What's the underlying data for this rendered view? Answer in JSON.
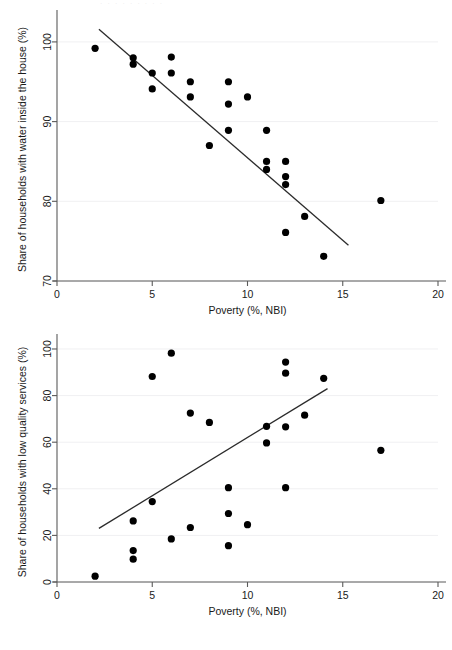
{
  "figure": {
    "ghost_caption": "· · · · · · · · ·",
    "background_color": "#ffffff",
    "point_color": "#000000",
    "fit_line_color": "#2b2b2b",
    "axis_color": "#5a5a5a"
  },
  "chart_data": [
    {
      "id": "water-inside-house",
      "type": "scatter",
      "title": "",
      "xlabel": "Poverty (%, NBI)",
      "ylabel": "Share of households with water inside the house (%)",
      "xlim": [
        0,
        20
      ],
      "ylim": [
        70,
        103
      ],
      "xticks": [
        0,
        5,
        10,
        15,
        20
      ],
      "xtick_labels": [
        "0",
        "5",
        "10",
        "15",
        "20"
      ],
      "yticks": [
        70,
        80,
        90,
        100
      ],
      "ytick_labels": [
        "70",
        "80",
        "90",
        "100"
      ],
      "grid": true,
      "legend": "none",
      "points": [
        {
          "x": 2.0,
          "y": 99.2
        },
        {
          "x": 4.0,
          "y": 98.0
        },
        {
          "x": 4.0,
          "y": 97.2
        },
        {
          "x": 5.0,
          "y": 96.1
        },
        {
          "x": 5.0,
          "y": 94.1
        },
        {
          "x": 6.0,
          "y": 98.1
        },
        {
          "x": 6.0,
          "y": 96.1
        },
        {
          "x": 7.0,
          "y": 95.0
        },
        {
          "x": 7.0,
          "y": 93.1
        },
        {
          "x": 8.0,
          "y": 87.0
        },
        {
          "x": 9.0,
          "y": 95.0
        },
        {
          "x": 9.0,
          "y": 92.2
        },
        {
          "x": 9.0,
          "y": 88.9
        },
        {
          "x": 10.0,
          "y": 93.1
        },
        {
          "x": 11.0,
          "y": 88.9
        },
        {
          "x": 11.0,
          "y": 85.0
        },
        {
          "x": 11.0,
          "y": 84.0
        },
        {
          "x": 12.0,
          "y": 85.0
        },
        {
          "x": 12.0,
          "y": 83.1
        },
        {
          "x": 12.0,
          "y": 82.1
        },
        {
          "x": 12.0,
          "y": 76.1
        },
        {
          "x": 13.0,
          "y": 78.1
        },
        {
          "x": 14.0,
          "y": 73.1
        },
        {
          "x": 17.0,
          "y": 80.1
        }
      ],
      "fit_line": {
        "x1": 2.2,
        "y1": 101.6,
        "x2": 15.3,
        "y2": 74.5
      }
    },
    {
      "id": "low-quality-services",
      "type": "scatter",
      "title": "",
      "xlabel": "Poverty (%, NBI)",
      "ylabel": "Share of households with low quality services (%)",
      "xlim": [
        0,
        20
      ],
      "ylim": [
        0,
        103
      ],
      "xticks": [
        0,
        5,
        10,
        15,
        20
      ],
      "xtick_labels": [
        "0",
        "5",
        "10",
        "15",
        "20"
      ],
      "yticks": [
        0,
        20,
        40,
        60,
        80,
        100
      ],
      "ytick_labels": [
        "0",
        "20",
        "40",
        "60",
        "80",
        "100"
      ],
      "grid": true,
      "legend": "none",
      "points": [
        {
          "x": 2.0,
          "y": 2.5
        },
        {
          "x": 4.0,
          "y": 13.5
        },
        {
          "x": 4.0,
          "y": 9.8
        },
        {
          "x": 4.0,
          "y": 26.2
        },
        {
          "x": 5.0,
          "y": 88.2
        },
        {
          "x": 5.0,
          "y": 34.5
        },
        {
          "x": 6.0,
          "y": 98.2
        },
        {
          "x": 6.0,
          "y": 18.5
        },
        {
          "x": 7.0,
          "y": 72.5
        },
        {
          "x": 7.0,
          "y": 23.4
        },
        {
          "x": 8.0,
          "y": 68.5
        },
        {
          "x": 9.0,
          "y": 40.5
        },
        {
          "x": 9.0,
          "y": 29.4
        },
        {
          "x": 9.0,
          "y": 15.6
        },
        {
          "x": 10.0,
          "y": 24.6
        },
        {
          "x": 11.0,
          "y": 66.8
        },
        {
          "x": 11.0,
          "y": 59.7
        },
        {
          "x": 12.0,
          "y": 94.4
        },
        {
          "x": 12.0,
          "y": 89.6
        },
        {
          "x": 12.0,
          "y": 66.6
        },
        {
          "x": 12.0,
          "y": 40.5
        },
        {
          "x": 13.0,
          "y": 71.6
        },
        {
          "x": 14.0,
          "y": 87.4
        },
        {
          "x": 17.0,
          "y": 56.5
        }
      ],
      "fit_line": {
        "x1": 2.2,
        "y1": 23.0,
        "x2": 14.2,
        "y2": 83.0
      }
    }
  ]
}
